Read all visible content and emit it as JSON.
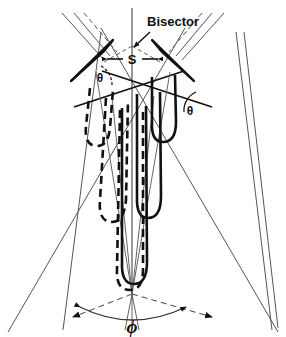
{
  "figure": {
    "type": "optical-ray-diagram",
    "background_color": "#ffffff",
    "line_color": "#1a1a1a",
    "thin_line_color": "#4a4a4a",
    "labels": {
      "bisector": "Bisector",
      "separation": "S",
      "angle_left": "θ",
      "angle_right": "θ",
      "full_angle": "ϕ"
    },
    "elements": {
      "bisector_axis": "vertical-center-line",
      "left_prism": "wedge-prism-left",
      "right_prism": "wedge-prism-right",
      "separation_arrow": "double-headed-horizontal-arrow",
      "left_rays": "dashed-ray-bundle",
      "right_rays": "solid-ray-bundle",
      "convergence_point": "focus",
      "phi_arc": "angle-arc-with-arrowheads"
    },
    "geometry": {
      "center_x": 132,
      "focus_y": 294,
      "prism_left_apex_x": 73,
      "prism_right_apex_x": 200,
      "prism_top_y": 42,
      "arc_y": 309
    }
  }
}
